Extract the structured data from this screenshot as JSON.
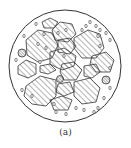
{
  "figure": {
    "caption": "(a)",
    "colors": {
      "stroke": "#333333",
      "background": "#ffffff"
    },
    "outline": {
      "cx": 65,
      "cy": 66,
      "r": 56
    },
    "aggregates": [
      "52,30 60,22 72,24 76,34 68,42 55,40",
      "26,40 38,30 52,33 58,45 52,58 38,62 27,55",
      "58,40 70,38 76,46 70,54 58,52",
      "74,38 88,30 100,34 104,48 96,58 82,58 74,48",
      "50,52 64,48 76,56 74,66 62,70 50,64",
      "92,56 106,52 114,60 110,72 96,72 90,64",
      "18,66 26,60 36,64 36,74 28,78 18,74",
      "40,66 50,64 56,70 48,74 40,72",
      "62,64 74,62 82,70 76,80 64,80 60,72",
      "84,66 96,64 100,72 92,78 84,76",
      "26,86 40,76 56,80 56,96 46,106 32,104 24,96",
      "58,84 70,82 74,92 64,96 56,92",
      "74,82 90,78 100,88 96,102 82,104 74,96",
      "50,100 62,96 72,100 68,110 54,110",
      "42,22 50,18 58,22 54,28 44,28"
    ],
    "inclusions": [
      {
        "cx": 22,
        "cy": 53,
        "r": 4
      },
      {
        "cx": 60,
        "cy": 79,
        "r": 3.5
      },
      {
        "cx": 106,
        "cy": 80,
        "r": 4
      }
    ],
    "pores": [
      [
        36,
        24
      ],
      [
        44,
        34
      ],
      [
        58,
        33
      ],
      [
        66,
        30
      ],
      [
        90,
        22
      ],
      [
        96,
        26
      ],
      [
        100,
        30
      ],
      [
        98,
        36
      ],
      [
        106,
        33
      ],
      [
        110,
        40
      ],
      [
        86,
        26
      ],
      [
        82,
        30
      ],
      [
        16,
        60
      ],
      [
        22,
        90
      ],
      [
        40,
        62
      ],
      [
        104,
        98
      ],
      [
        110,
        88
      ],
      [
        98,
        108
      ],
      [
        94,
        112
      ],
      [
        84,
        110
      ],
      [
        76,
        108
      ],
      [
        66,
        114
      ],
      [
        56,
        112
      ],
      [
        32,
        96
      ],
      [
        64,
        56
      ],
      [
        46,
        48
      ],
      [
        110,
        68
      ],
      [
        54,
        104
      ],
      [
        100,
        46
      ],
      [
        24,
        36
      ],
      [
        38,
        44
      ]
    ]
  }
}
